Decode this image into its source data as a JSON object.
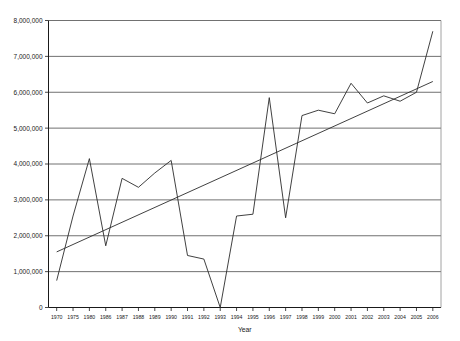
{
  "chart_data": {
    "type": "line",
    "title": "",
    "xlabel": "Year",
    "ylabel": "",
    "grid": true,
    "legend": "none",
    "ylim": [
      0,
      8000000
    ],
    "ytick_step": 1000000,
    "ytick_labels": [
      "0",
      "1,000,000",
      "2,000,000",
      "3,000,000",
      "4,000,000",
      "5,000,000",
      "6,000,000",
      "7,000,000",
      "8,000,000"
    ],
    "ytick_values": [
      0,
      1000000,
      2000000,
      3000000,
      4000000,
      5000000,
      6000000,
      7000000,
      8000000
    ],
    "categories": [
      "1970",
      "1975",
      "1980",
      "1986",
      "1987",
      "1988",
      "1989",
      "1990",
      "1991",
      "1992",
      "1993",
      "1994",
      "1995",
      "1996",
      "1997",
      "1998",
      "1999",
      "2000",
      "2001",
      "2002",
      "2003",
      "2004",
      "2005",
      "2006"
    ],
    "series": [
      {
        "name": "data",
        "values": [
          750000,
          2550000,
          4150000,
          1720000,
          3600000,
          3350000,
          3750000,
          4100000,
          1450000,
          1350000,
          0,
          2550000,
          2600000,
          5850000,
          2500000,
          5350000,
          5500000,
          5400000,
          6250000,
          5700000,
          5900000,
          5750000,
          6000000,
          7700000
        ]
      },
      {
        "name": "trendline",
        "type": "linear-trend",
        "start_value": 1550000,
        "end_value": 6300000
      }
    ],
    "axis_title": "Year"
  },
  "colors": {
    "background": "#ffffff",
    "series_line": "#2b2b2b",
    "trend_line": "#2b2b2b",
    "gridline": "#4d4d4d",
    "axis": "#1a1a1a",
    "text": "#1a1a1a"
  }
}
